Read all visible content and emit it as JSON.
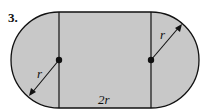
{
  "problem": {
    "number": "3.",
    "labels": {
      "left_radius": "r",
      "right_radius": "r",
      "bottom_width": "2r"
    },
    "colors": {
      "fill": "#c8c8c8",
      "stroke": "#111111"
    }
  }
}
